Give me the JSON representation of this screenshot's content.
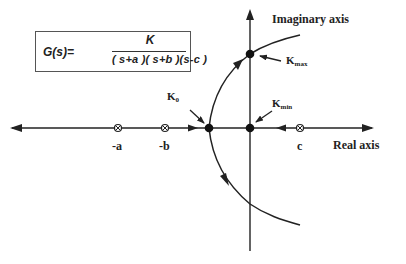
{
  "formula": {
    "lhs": "G(s)=",
    "numerator": "K",
    "denominator": "( s+a )( s+b )(s-c )"
  },
  "axes": {
    "imaginary_label": "Imaginary axis",
    "real_label": "Real axis"
  },
  "poles": [
    {
      "label": "-a",
      "x": 118
    },
    {
      "label": "-b",
      "x": 165
    },
    {
      "label": "c",
      "x": 300
    }
  ],
  "gain_points": {
    "k0": {
      "base": "K",
      "sub": "0"
    },
    "kmax": {
      "base": "K",
      "sub": "max"
    },
    "kmin": {
      "base": "K",
      "sub": "min"
    }
  },
  "colors": {
    "stroke": "#222222",
    "box_border": "#555555",
    "background": "#ffffff"
  }
}
